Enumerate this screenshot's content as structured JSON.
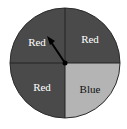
{
  "spinner": {
    "sections": [
      {
        "label": "Red",
        "position": "top-left",
        "fill": "#4a4a4a",
        "text_color": "#ffffff"
      },
      {
        "label": "Red",
        "position": "top-right",
        "fill": "#4a4a4a",
        "text_color": "#ffffff"
      },
      {
        "label": "Red",
        "position": "bottom-left",
        "fill": "#4a4a4a",
        "text_color": "#ffffff"
      },
      {
        "label": "Blue",
        "position": "bottom-right",
        "fill": "#b4b4b4",
        "text_color": "#111111"
      }
    ],
    "pointer": {
      "direction": "top-left section"
    }
  }
}
